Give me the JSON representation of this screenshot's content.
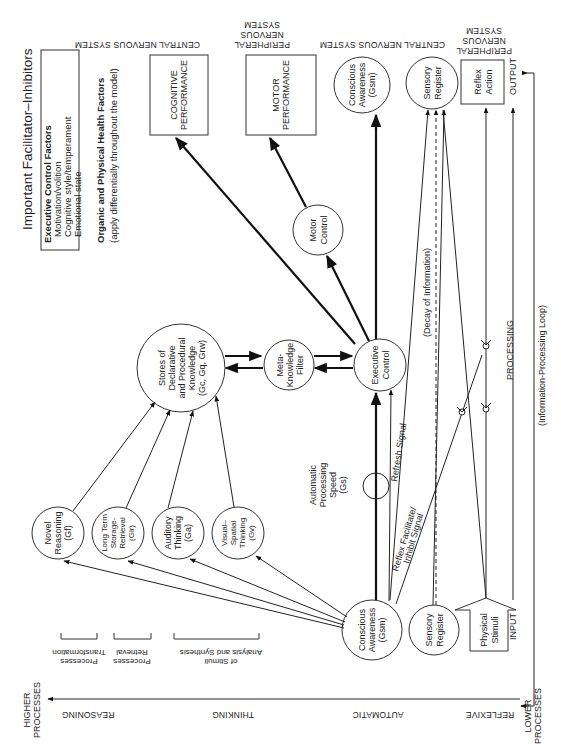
{
  "legend": {
    "title": "Important Facilitator–Inhibitors",
    "executive_heading": "Executive Control Factors",
    "executive_items": [
      "Motivation/volition",
      "Cognitive style/temperament",
      "Emotional state"
    ],
    "health_heading": "Organic and Physical Health Factors",
    "health_note": "(apply differentially throughout the model)"
  },
  "system_headers": {
    "cns_top": "CENTRAL NERVOUS SYSTEM",
    "pns_motor": [
      "PERIPHERAL",
      "NERVOUS",
      "SYSTEM"
    ],
    "cns_mid": "CENTRAL NERVOUS SYSTEM",
    "pns_reflex": [
      "PERIPHERAL",
      "NERVOUS",
      "SYSTEM"
    ]
  },
  "nodes": {
    "cognitive_performance": [
      "COGNITIVE",
      "PERFORMANCE"
    ],
    "motor_performance": [
      "MOTOR",
      "PERFORMANCE"
    ],
    "conscious_awareness_top": [
      "Conscious",
      "Awareness",
      "(Gsm)"
    ],
    "sensory_register_top": [
      "Sensory",
      "Register"
    ],
    "reflex_action": [
      "Reflex",
      "Action"
    ],
    "stores_knowledge": [
      "Stores of",
      "Declarative",
      "and Procedural",
      "Knowledge",
      "(Gc, Gq, Grw)"
    ],
    "meta_knowledge": [
      "Meta-",
      "Knowledge",
      "Filter"
    ],
    "executive_control": [
      "Executive",
      "Control"
    ],
    "motor_control": [
      "Motor",
      "Control"
    ],
    "novel_reasoning": [
      "Novel",
      "Reasoning",
      "(Gf)"
    ],
    "long_term": [
      "Long Term",
      "Storage-",
      "Retrieval",
      "(Glr)"
    ],
    "auditory": [
      "Auditory",
      "Thinking",
      "(Ga)"
    ],
    "visual_spatial": [
      "Visual–",
      "Spatial",
      "Thinking",
      "(Gv)"
    ],
    "conscious_awareness_bottom": [
      "Conscious",
      "Awareness",
      "(Gsm)"
    ],
    "sensory_register_bottom": [
      "Sensory",
      "Register"
    ],
    "physical_stimuli": [
      "Physical",
      "Stimuli"
    ],
    "automatic_processing": [
      "Automatic",
      "Processing",
      "Speed",
      "(Gs)"
    ]
  },
  "edge_labels": {
    "refresh": "Refresh Signal",
    "reflex_signal": [
      "Reflex Facilitate/",
      "Inhibit Signal"
    ],
    "decay": "(Decay of Information)",
    "processing": "PROCESSING",
    "loop": "(Information-Processing Loop)",
    "output": "OUTPUT",
    "input": "INPUT"
  },
  "brackets": {
    "transformation": [
      "Transformation",
      "Processes"
    ],
    "retrieval": [
      "Retrieval",
      "Processes"
    ],
    "analysis": [
      "Analysis and Synthesis",
      "of Stimuli"
    ]
  },
  "axis": {
    "higher": [
      "HIGHER",
      "PROCESSES"
    ],
    "lower": [
      "LOWER",
      "PROCESSES"
    ],
    "levels": [
      "REASONING",
      "THINKING",
      "AUTOMATIC",
      "REFLEXIVE"
    ]
  }
}
